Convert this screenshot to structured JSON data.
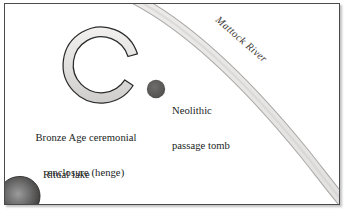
{
  "figure": {
    "name": "archaeological-site-map",
    "background_color": "#ffffff",
    "border_color": "#4a4a4a"
  },
  "labels": {
    "henge": {
      "line1": "Bronze Age ceremonial",
      "line2": "enclosure (henge)"
    },
    "tomb": {
      "line1": "Neolithic",
      "line2": "passage tomb"
    },
    "lake": "Ritual lake",
    "river": "Mattock River"
  },
  "features": {
    "henge": {
      "shape": "open-ring",
      "fill": "#e3e1df",
      "stroke": "#2b2b2b",
      "center_x": 102,
      "center_y": 62,
      "outer_radius": 38,
      "inner_radius": 28,
      "gap_opening": "east"
    },
    "tomb": {
      "shape": "circle",
      "fill": "#5d5c5b",
      "center_x": 155,
      "center_y": 86,
      "radius": 9
    },
    "lake": {
      "shape": "blob",
      "fill_center": "#8e8d8d",
      "fill_edge": "#3a3938",
      "center_x": 16,
      "center_y": 196,
      "radius_x": 19,
      "radius_y": 17
    },
    "river": {
      "shape": "curved-band",
      "fill": "#e7e6e5",
      "stroke": "#9b9a99",
      "width": 9,
      "enters_at": "top-edge",
      "exits_at": "right-edge"
    }
  }
}
